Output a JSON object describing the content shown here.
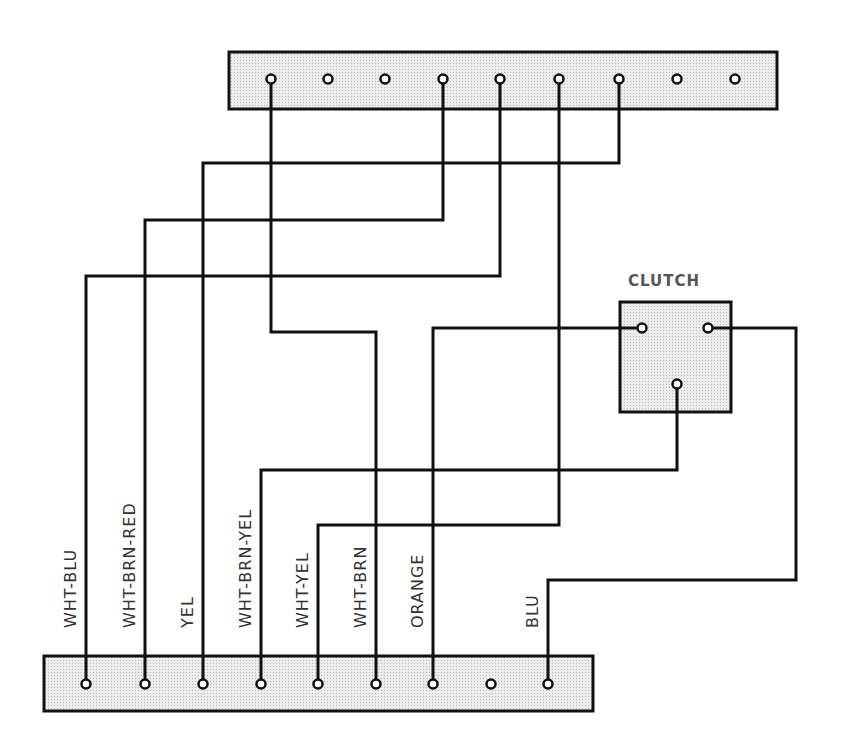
{
  "diagram": {
    "clutch_label": "CLUTCH",
    "wire_labels": [
      {
        "text": "WHT-BLU",
        "x": 86
      },
      {
        "text": "WHT-BRN-RED",
        "x": 145
      },
      {
        "text": "YEL",
        "x": 203
      },
      {
        "text": "WHT-BRN-YEL",
        "x": 261
      },
      {
        "text": "WHT-YEL",
        "x": 318
      },
      {
        "text": "WHT-BRN",
        "x": 376
      },
      {
        "text": "ORANGE",
        "x": 433
      },
      {
        "text": "BLU",
        "x": 548
      }
    ],
    "top_strip": {
      "terminal_count": 9
    },
    "bottom_strip": {
      "terminal_count": 9
    },
    "clutch": {
      "terminal_count": 3
    },
    "colors": {
      "line": "#111111",
      "fill": "#e2e2e2",
      "label": "#333333"
    }
  }
}
